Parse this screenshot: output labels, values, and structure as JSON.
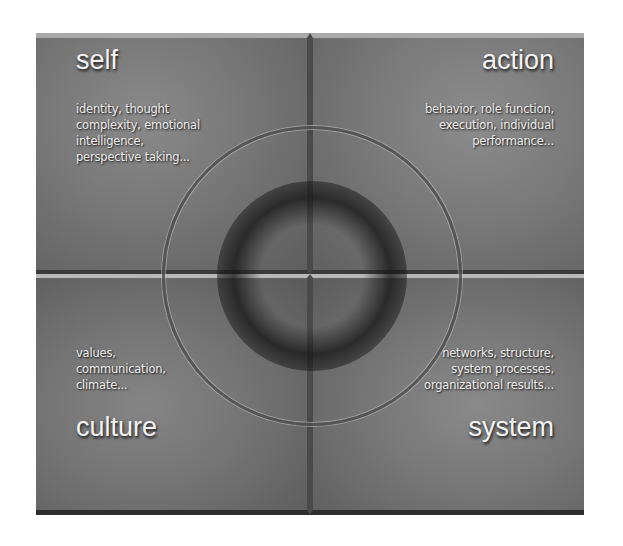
{
  "diagram": {
    "type": "four-quadrant",
    "quadrants": [
      {
        "position": "top-left",
        "title": "self",
        "description_lines": [
          "identity, thought",
          "complexity, emotional",
          "intelligence,",
          "perspective taking..."
        ]
      },
      {
        "position": "top-right",
        "title": "action",
        "description_lines": [
          "behavior, role function,",
          "execution, individual",
          "performance..."
        ]
      },
      {
        "position": "bottom-left",
        "title": "culture",
        "description_lines": [
          "values,",
          "communication,",
          "climate..."
        ]
      },
      {
        "position": "bottom-right",
        "title": "system",
        "description_lines": [
          "networks, structure,",
          "system processes,",
          "organizational results..."
        ]
      }
    ],
    "colors": {
      "panel": "#6e6e6e",
      "text": "#f2f2f2",
      "background": "#ffffff"
    }
  }
}
